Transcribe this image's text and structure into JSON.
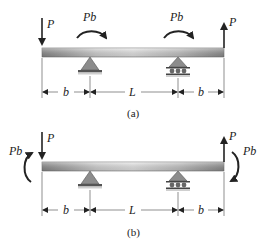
{
  "figure": {
    "diagrams": [
      {
        "id": "a",
        "caption": "(a)",
        "loads": {
          "left_force": "P",
          "left_force_direction": "down",
          "moment_left": "Pb",
          "moment_left_direction": "clockwise",
          "moment_right": "Pb",
          "moment_right_direction": "clockwise",
          "right_force": "P",
          "right_force_direction": "up"
        },
        "dimensions": [
          "b",
          "L",
          "b"
        ],
        "supports": [
          "pin",
          "roller"
        ]
      },
      {
        "id": "b",
        "caption": "(b)",
        "loads": {
          "left_force": "P",
          "left_force_direction": "down",
          "left_end_moment": "Pb",
          "left_end_moment_direction": "counterclockwise",
          "right_force": "P",
          "right_force_direction": "up",
          "right_end_moment": "Pb",
          "right_end_moment_direction": "clockwise"
        },
        "dimensions": [
          "b",
          "L",
          "b"
        ],
        "supports": [
          "pin",
          "roller"
        ]
      }
    ],
    "colors": {
      "beam_dark": "#8a8a8a",
      "beam_light": "#e6e6e6",
      "support": "#8c8c8c",
      "ink": "#222222"
    }
  }
}
